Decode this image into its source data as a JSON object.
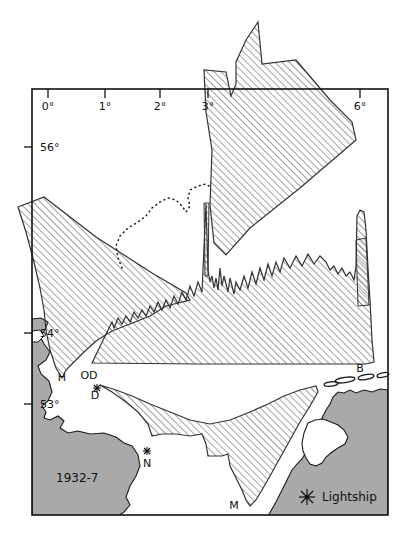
{
  "map": {
    "title_note": "1932-7",
    "frame": {
      "x": 32,
      "y": 89,
      "width": 356,
      "height": 426,
      "color": "#111111"
    },
    "axes": {
      "longitude_unit": "°",
      "latitude_unit": "°",
      "top_ticks": [
        {
          "label": "0°",
          "x": 48
        },
        {
          "label": "1°",
          "x": 105
        },
        {
          "label": "2°",
          "x": 160
        },
        {
          "label": "3°",
          "x": 208
        },
        {
          "label": "6°",
          "x": 360
        }
      ],
      "left_ticks": [
        {
          "label": "56°",
          "y": 147
        },
        {
          "label": "54°",
          "y": 333
        },
        {
          "label": "53°",
          "y": 404
        }
      ]
    },
    "legend": {
      "symbol_name": "lightship-star",
      "label": "Lightship"
    },
    "station_labels": [
      {
        "id": "H",
        "text": "H",
        "x": 62,
        "y": 381
      },
      {
        "id": "OD",
        "text": "OD",
        "x": 87,
        "y": 379
      },
      {
        "id": "D",
        "text": "D",
        "x": 94,
        "y": 398
      },
      {
        "id": "N",
        "text": "N",
        "x": 145,
        "y": 466
      },
      {
        "id": "M",
        "text": "M",
        "x": 235,
        "y": 508
      },
      {
        "id": "B",
        "text": "B",
        "x": 360,
        "y": 372
      }
    ],
    "lightship_markers": [
      {
        "near": "D",
        "x": 97,
        "y": 388
      },
      {
        "near": "N",
        "x": 148,
        "y": 451
      }
    ],
    "colors": {
      "land": "#a9a9a9",
      "land_stroke": "#1a1a1a",
      "hatch_stroke": "#4a4a4a",
      "outline": "#111111",
      "sea": "#ffffff",
      "text": "#111111"
    },
    "features": {
      "hatched_regions_count": 4,
      "dotted_boundary": true,
      "sandbank_dashes_count": 5
    }
  }
}
